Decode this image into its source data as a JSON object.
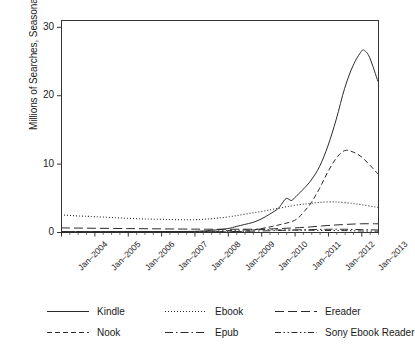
{
  "chart_data": {
    "type": "line",
    "title": "",
    "xlabel": "",
    "ylabel": "Millions of Searches, Seasonally Adjusted",
    "ylim": [
      0,
      31
    ],
    "yticks": [
      0,
      10,
      20,
      30
    ],
    "ytick_labels": [
      "0",
      "10",
      "20",
      "30"
    ],
    "xtick_labels": [
      "Jan–2004",
      "Jan–2005",
      "Jan–2006",
      "Jan–2007",
      "Jan–2008",
      "Jan–2009",
      "Jan–2010",
      "Jan–2011",
      "Jan–2012",
      "Jan–2013"
    ],
    "x_minor_ticks_per_year": 4,
    "grid": false,
    "legend_position": "bottom",
    "x_start": 2004.0,
    "x_end": 2013.5,
    "series": [
      {
        "name": "Kindle",
        "dash": "solid",
        "x": [
          2004.0,
          2005.0,
          2006.0,
          2007.0,
          2008.0,
          2008.5,
          2009.0,
          2009.25,
          2009.5,
          2009.75,
          2010.0,
          2010.25,
          2010.5,
          2010.6,
          2010.75,
          2010.9,
          2011.0,
          2011.25,
          2011.5,
          2011.75,
          2012.0,
          2012.25,
          2012.5,
          2012.75,
          2013.0,
          2013.1,
          2013.25,
          2013.5
        ],
        "values": [
          0.05,
          0.05,
          0.06,
          0.07,
          0.1,
          0.25,
          0.5,
          0.8,
          1.1,
          1.4,
          1.9,
          2.6,
          3.4,
          4.0,
          4.9,
          4.6,
          5.0,
          6.2,
          7.6,
          9.6,
          12.6,
          16.5,
          21.0,
          24.3,
          26.4,
          26.5,
          25.5,
          22.0
        ]
      },
      {
        "name": "Nook",
        "dash": "dashed",
        "x": [
          2004.0,
          2006.0,
          2008.0,
          2009.0,
          2009.5,
          2010.0,
          2010.5,
          2011.0,
          2011.25,
          2011.5,
          2011.75,
          2012.0,
          2012.25,
          2012.5,
          2012.75,
          2013.0,
          2013.25,
          2013.5
        ],
        "values": [
          0.0,
          0.0,
          0.0,
          0.02,
          0.1,
          0.5,
          1.0,
          1.7,
          2.8,
          4.3,
          6.4,
          8.8,
          10.8,
          11.9,
          11.7,
          11.0,
          9.8,
          8.5
        ]
      },
      {
        "name": "Ebook",
        "dash": "dotted",
        "x": [
          2004.0,
          2004.5,
          2005.0,
          2006.0,
          2007.0,
          2008.0,
          2008.5,
          2009.0,
          2009.5,
          2010.0,
          2010.5,
          2011.0,
          2011.5,
          2012.0,
          2012.5,
          2013.0,
          2013.5
        ],
        "values": [
          2.5,
          2.35,
          2.25,
          2.0,
          1.85,
          1.8,
          1.95,
          2.2,
          2.6,
          3.0,
          3.45,
          3.9,
          4.2,
          4.4,
          4.3,
          4.0,
          3.6
        ]
      },
      {
        "name": "Ereader",
        "dash": "longdash",
        "x": [
          2004.0,
          2006.0,
          2008.0,
          2009.0,
          2010.0,
          2010.5,
          2011.0,
          2011.5,
          2012.0,
          2012.5,
          2013.0,
          2013.5
        ],
        "values": [
          0.6,
          0.5,
          0.42,
          0.4,
          0.42,
          0.5,
          0.6,
          0.75,
          0.95,
          1.1,
          1.2,
          1.2
        ]
      },
      {
        "name": "Epub",
        "dash": "dashdot",
        "x": [
          2004.0,
          2006.0,
          2008.0,
          2009.0,
          2010.0,
          2010.5,
          2011.0,
          2011.5,
          2012.0,
          2012.5,
          2013.0,
          2013.5
        ],
        "values": [
          0.02,
          0.02,
          0.03,
          0.06,
          0.15,
          0.22,
          0.3,
          0.35,
          0.4,
          0.4,
          0.35,
          0.3
        ]
      },
      {
        "name": "Sony Ebook Reader",
        "dash": "dashdotdot",
        "x": [
          2004.0,
          2006.0,
          2008.0,
          2008.5,
          2009.0,
          2009.5,
          2010.0,
          2010.5,
          2011.0,
          2011.5,
          2012.0,
          2012.5,
          2013.0,
          2013.5
        ],
        "values": [
          0.01,
          0.01,
          0.05,
          0.1,
          0.2,
          0.3,
          0.35,
          0.3,
          0.28,
          0.25,
          0.22,
          0.2,
          0.15,
          0.12
        ]
      }
    ]
  },
  "legend": {
    "items": [
      {
        "label": "Kindle"
      },
      {
        "label": "Ebook"
      },
      {
        "label": "Ereader"
      },
      {
        "label": "Nook"
      },
      {
        "label": "Epub"
      },
      {
        "label": "Sony Ebook Reader"
      }
    ]
  }
}
